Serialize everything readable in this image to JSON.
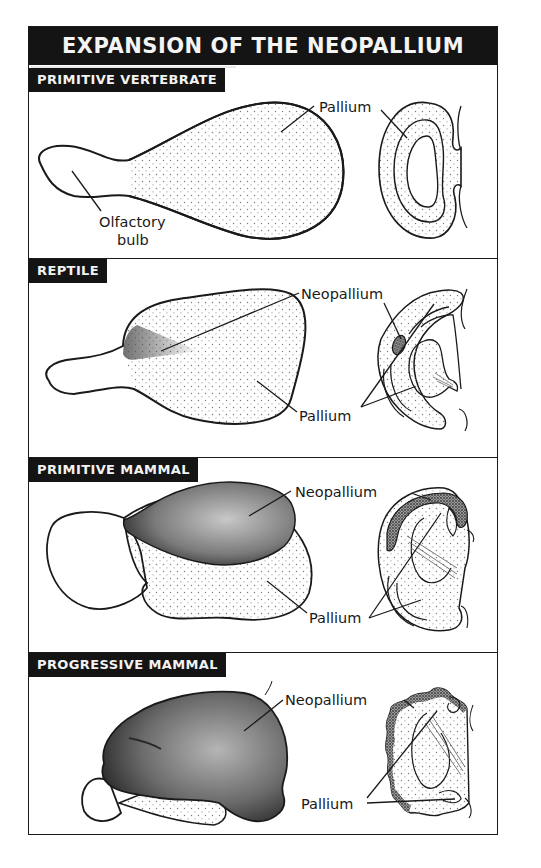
{
  "title": "EXPANSION OF THE NEOPALLIUM",
  "panels": [
    {
      "id": "primitive-vertebrate",
      "heading": "PRIMITIVE VERTEBRATE",
      "labels": {
        "pallium": "Pallium",
        "olfactory_line1": "Olfactory",
        "olfactory_line2": "bulb"
      }
    },
    {
      "id": "reptile",
      "heading": "REPTILE",
      "labels": {
        "neopallium": "Neopallium",
        "pallium": "Pallium"
      }
    },
    {
      "id": "primitive-mammal",
      "heading": "PRIMITIVE MAMMAL",
      "labels": {
        "neopallium": "Neopallium",
        "pallium": "Pallium"
      }
    },
    {
      "id": "progressive-mammal",
      "heading": "PROGRESSIVE MAMMAL",
      "labels": {
        "neopallium": "Neopallium",
        "pallium": "Pallium"
      }
    }
  ],
  "colors": {
    "ink": "#1a1a1a",
    "header_bg": "#141414",
    "header_text": "#f4f4f4",
    "paper": "#ffffff",
    "stipple": "#8a8a8a"
  }
}
